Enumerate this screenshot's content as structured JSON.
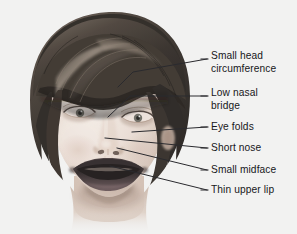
{
  "figure": {
    "kind": "annotated-photo-diagram",
    "background_color": "#f3f3f2",
    "text_color": "#17171a",
    "leader_line_color": "#2a2a2e",
    "width": 297,
    "height": 234
  },
  "callouts": [
    {
      "id": "small-head-circumference",
      "label": "Small head\ncircumference",
      "text_x": 211,
      "text_y": 50,
      "line": [
        [
          118,
          87
        ],
        [
          133,
          72
        ],
        [
          207,
          59
        ]
      ],
      "dash_x": 201,
      "dash_y": 59
    },
    {
      "id": "low-nasal-bridge",
      "label": "Low nasal\nbridge",
      "text_x": 211,
      "text_y": 87,
      "line": [
        [
          108,
          117
        ],
        [
          130,
          96
        ],
        [
          207,
          96
        ]
      ],
      "dash_x": 201,
      "dash_y": 96
    },
    {
      "id": "eye-folds",
      "label": "Eye folds",
      "text_x": 211,
      "text_y": 121,
      "line": [
        [
          132,
          132
        ],
        [
          207,
          127
        ]
      ],
      "dash_x": 201,
      "dash_y": 127
    },
    {
      "id": "short-nose",
      "label": "Short nose",
      "text_x": 211,
      "text_y": 142,
      "line": [
        [
          105,
          138
        ],
        [
          207,
          148
        ]
      ],
      "dash_x": 201,
      "dash_y": 148
    },
    {
      "id": "small-midface",
      "label": "Small midface",
      "text_x": 211,
      "text_y": 164,
      "line": [
        [
          117,
          148
        ],
        [
          207,
          170
        ]
      ],
      "dash_x": 201,
      "dash_y": 170
    },
    {
      "id": "thin-upper-lip",
      "label": "Thin upper lip",
      "text_x": 211,
      "text_y": 184,
      "line": [
        [
          110,
          166
        ],
        [
          207,
          190
        ]
      ],
      "dash_x": 201,
      "dash_y": 190
    }
  ],
  "portrait": {
    "hair_color_dark": "#2e2a27",
    "hair_color_mid": "#595049",
    "hair_color_light": "#a89b90",
    "skin_color_light": "#efe5de",
    "skin_color_mid": "#d6c6bb",
    "skin_color_shadow": "#b3a094",
    "lip_color": "#3d3436",
    "eye_color": "#3a3a36",
    "mouth_interior": "#201c1d"
  }
}
